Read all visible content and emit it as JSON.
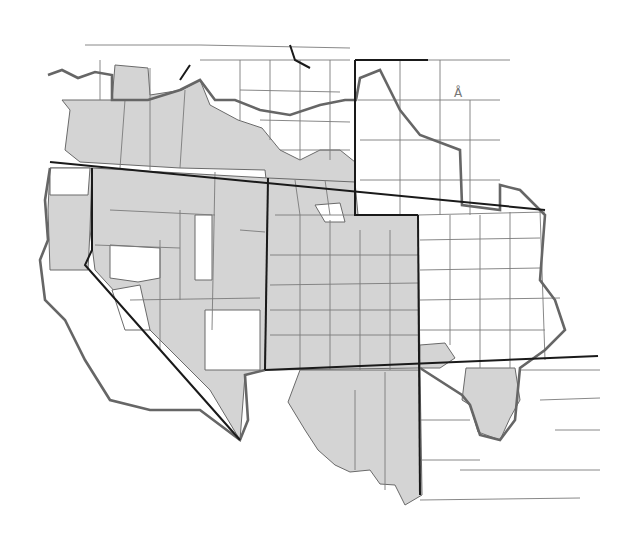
{
  "map": {
    "subject": "Western United States county map with shaded counties",
    "north_arrow_glyph": "Å",
    "colors": {
      "shaded": "#d4d4d4",
      "unshaded": "#ffffff",
      "state_border": "#1a1a1a",
      "region_border": "#666666",
      "county_border": "#7a7a7a"
    },
    "states_depicted": [
      "Oregon (southern part)",
      "Idaho (southern part)",
      "Wyoming (west)",
      "California (north/east)",
      "Nevada",
      "Utah",
      "Colorado",
      "Arizona (part)",
      "New Mexico (part)"
    ]
  }
}
